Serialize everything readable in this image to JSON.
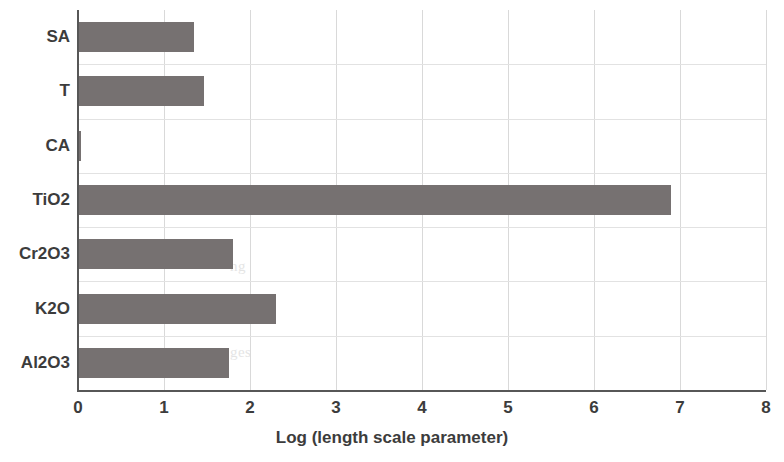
{
  "chart_data": {
    "type": "bar",
    "orientation": "horizontal",
    "title": "",
    "subtitle": "",
    "xlabel": "Log (length scale parameter)",
    "ylabel": "",
    "categories": [
      "SA",
      "T",
      "CA",
      "TiO2",
      "Cr2O3",
      "K2O",
      "Al2O3"
    ],
    "values": [
      1.35,
      1.47,
      0.03,
      6.9,
      1.8,
      2.3,
      1.75
    ],
    "series": [
      {
        "name": "Log (length scale parameter)",
        "values": [
          1.35,
          1.47,
          0.03,
          6.9,
          1.8,
          2.3,
          1.75
        ]
      }
    ],
    "xlim": [
      0,
      8
    ],
    "xticks": [
      "0",
      "1",
      "2",
      "3",
      "4",
      "5",
      "6",
      "7",
      "8"
    ],
    "grid": "vertical-and-horizontal",
    "legend": "none",
    "bar_color": "#767171",
    "grid_color": "#d9d9d9",
    "axis_color": "#575757"
  },
  "axis": {
    "x_title": "Log (length scale parameter)",
    "tick_labels": [
      "0",
      "1",
      "2",
      "3",
      "4",
      "5",
      "6",
      "7",
      "8"
    ],
    "category_labels": [
      "SA",
      "T",
      "CA",
      "TiO2",
      "Cr2O3",
      "K2O",
      "Al2O3"
    ]
  },
  "background_text": {
    "line1": "ng",
    "line2": "are",
    "line3": "ges"
  }
}
